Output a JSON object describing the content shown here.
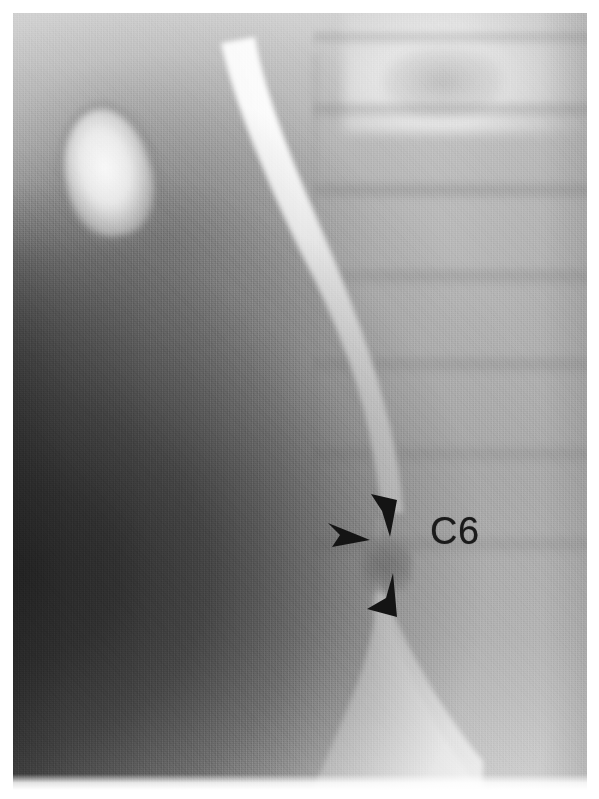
{
  "figure": {
    "kind": "lateral-barium-swallow-radiograph",
    "modality_label": "fluoroscopic lateral view of the pharynx and cervical esophagus",
    "background_color": "#ffffff",
    "plate": {
      "x": 13,
      "y": 13,
      "width": 574,
      "height": 777,
      "tone_light": "#d8d8d8",
      "tone_mid": "#b5b5b5",
      "tone_dark": "#1e1e1e",
      "contrast_color": "#ffffff"
    }
  },
  "annotations": {
    "label": {
      "text": "C6",
      "color": "#1a1a1a",
      "x": 430,
      "y": 512,
      "font_size_px": 38,
      "meaning": "sixth cervical vertebral level"
    },
    "arrowheads": [
      {
        "name": "upper-arrowhead",
        "x": 366,
        "y": 491,
        "width": 34,
        "height": 48,
        "direction": "down-left",
        "color": "#141414",
        "points_at": "superior margin of the posterior indentation"
      },
      {
        "name": "middle-arrowhead",
        "x": 326,
        "y": 520,
        "width": 46,
        "height": 30,
        "direction": "right",
        "color": "#141414",
        "points_at": "the cricopharyngeal bar / posterior impression"
      },
      {
        "name": "lower-arrowhead",
        "x": 364,
        "y": 571,
        "width": 36,
        "height": 50,
        "direction": "up-right",
        "color": "#141414",
        "points_at": "inferior margin of the posterior indentation"
      }
    ]
  },
  "anatomy": {
    "structures": [
      {
        "name": "barium-column",
        "description": "bright contrast-filled pharynx and cervical esophagus running top-left to bottom-right"
      },
      {
        "name": "hyoid-region-opacity",
        "description": "bright rounded opacity in the upper left"
      },
      {
        "name": "cervical-vertebral-bodies",
        "description": "stacked vertebral bodies along the right side of the film"
      },
      {
        "name": "posterior-indentation",
        "description": "gray notch indenting the posterior wall of the barium column at the C6 level"
      },
      {
        "name": "soft-tissue-shadow",
        "description": "dark anterior soft tissue and air shadow filling the lower left"
      }
    ]
  }
}
